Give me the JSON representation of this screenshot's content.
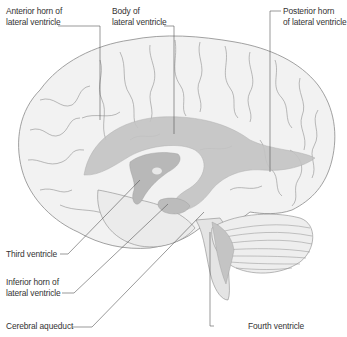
{
  "diagram": {
    "colors": {
      "brain_fill": "#f2f2f2",
      "outline": "#8a8a8a",
      "ventricle_fill": "#c4c4c4",
      "ventricle_light": "#d9d9d9",
      "leader_line": "#555555",
      "text": "#333333"
    },
    "labels": {
      "anterior_horn": {
        "line1": "Anterior horn of",
        "line2": "lateral ventricle"
      },
      "body": {
        "line1": "Body of",
        "line2": "lateral ventricle"
      },
      "posterior_horn": {
        "line1": "Posterior horn",
        "line2": "of lateral ventricle"
      },
      "third_ventricle": {
        "line1": "Third ventricle"
      },
      "inferior_horn": {
        "line1": "Inferior horn of",
        "line2": "lateral ventricle"
      },
      "cerebral_aqueduct": {
        "line1": "Cerebral aqueduct"
      },
      "fourth_ventricle": {
        "line1": "Fourth ventricle"
      }
    }
  }
}
